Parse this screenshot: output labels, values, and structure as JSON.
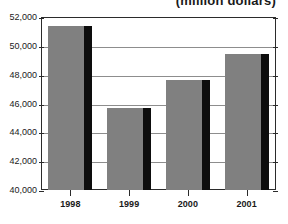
{
  "chart_data": {
    "type": "bar",
    "title": "(million dollars)",
    "xlabel": "",
    "ylabel": "",
    "categories": [
      "1998",
      "1999",
      "2000",
      "2001"
    ],
    "values": [
      51400,
      45700,
      47600,
      49400
    ],
    "ylim": [
      40000,
      52000
    ],
    "ytick_step": 2000,
    "ytick_labels": [
      "52,000",
      "50,000",
      "48,000",
      "46,000",
      "44,000",
      "42,000",
      "40,000"
    ],
    "ytick_values": [
      52000,
      50000,
      48000,
      46000,
      44000,
      42000,
      40000
    ],
    "grid": true,
    "legend": null,
    "bar_color": "#808080",
    "bar_shadow_color": "#0d0d0d",
    "axis_color": "#2b2b2b",
    "gridline_color": "#8d8d8d",
    "background_color": "#ffffff"
  }
}
